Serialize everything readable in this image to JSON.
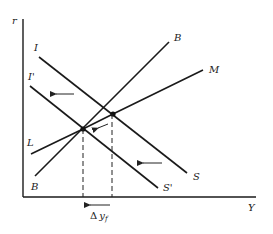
{
  "diagram": {
    "type": "economic-curve-diagram",
    "axes": {
      "y_label": "r",
      "x_label": "Y"
    },
    "curves": [
      {
        "id": "I",
        "label": "I",
        "kind": "downward",
        "shifted": false
      },
      {
        "id": "I_prime",
        "label": "I'",
        "kind": "downward",
        "shifted": true
      },
      {
        "id": "S",
        "label": "S",
        "kind": "downward",
        "shifted": false
      },
      {
        "id": "S_prime",
        "label": "S'",
        "kind": "downward",
        "shifted": true
      },
      {
        "id": "B_top",
        "label": "B",
        "kind": "upward"
      },
      {
        "id": "B_bottom",
        "label": "B",
        "kind": "upward"
      },
      {
        "id": "M",
        "label": "M",
        "kind": "upward"
      },
      {
        "id": "L",
        "label": "L",
        "kind": "upward"
      }
    ],
    "shift_arrows": [
      {
        "name": "I-shift-arrow",
        "direction": "left"
      },
      {
        "name": "S-shift-arrow",
        "direction": "left"
      },
      {
        "name": "equilibrium-shift-arrow",
        "direction": "down-left"
      },
      {
        "name": "delta-y-arrow",
        "direction": "left"
      }
    ],
    "annotation": {
      "delta_prefix": "Δ",
      "delta_var": "y",
      "delta_sub": "f"
    }
  }
}
